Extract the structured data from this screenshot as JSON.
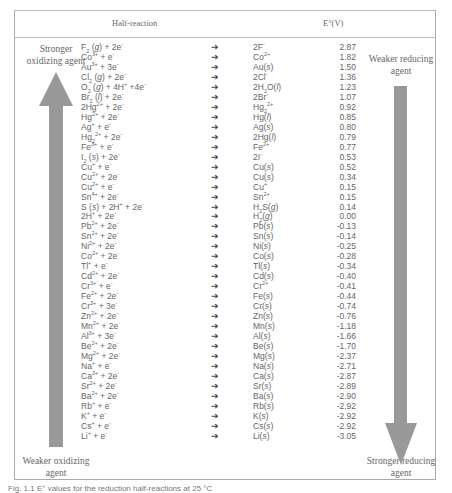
{
  "header": {
    "half_reaction": "Half-reaction",
    "potential": "E°(V)"
  },
  "labels": {
    "top_left": [
      "Stronger",
      "oxidizing agent"
    ],
    "bottom_left": [
      "Weaker oxidizing",
      "agent"
    ],
    "top_right": [
      "Weaker reducing",
      "agent"
    ],
    "bottom_right": [
      "Stronger reducing",
      "agent"
    ]
  },
  "arrow_symbol": "➔",
  "caption": "Fig. 1.1 E° values for the reduction half-reactions at 25 °C",
  "rows": [
    {
      "lhs": "F<sub>2</sub> (<i>g</i>) + 2e<sup>-</sup>",
      "rhs": "2F<sup>-</sup>",
      "e": "2.87"
    },
    {
      "lhs": "Co<sup>3+</sup> + e<sup>-</sup>",
      "rhs": "Co<sup>2+</sup>",
      "e": "1.82"
    },
    {
      "lhs": "Au<sup>3+</sup> + 3e<sup>-</sup>",
      "rhs": "Au(<i>s</i>)",
      "e": "1.50"
    },
    {
      "lhs": "Cl<sub>2</sub> (<i>g</i>) + 2e<sup>-</sup>",
      "rhs": "2Cl<sup>-</sup>",
      "e": "1.36"
    },
    {
      "lhs": "O<sub>2</sub> (<i>g</i>) + 4H<sup>+</sup> +4e<sup>-</sup>",
      "rhs": "2H<sub>2</sub>O(<i>l</i>)",
      "e": "1.23"
    },
    {
      "lhs": "Br<sub>2</sub> (<i>l</i>) + 2e<sup>-</sup>",
      "rhs": "2Br<sup>-</sup>",
      "e": "1.07"
    },
    {
      "lhs": "2Hg<sup>2+</sup> + 2e<sup>-</sup>",
      "rhs": "Hg<sub>2</sub><sup>2+</sup>",
      "e": "0.92"
    },
    {
      "lhs": "Hg<sup>2+</sup> + 2e<sup>-</sup>",
      "rhs": "Hg(<i>l</i>)",
      "e": "0.85"
    },
    {
      "lhs": "Ag<sup>+</sup> + e<sup>-</sup>",
      "rhs": "Ag(<i>s</i>)",
      "e": "0.80"
    },
    {
      "lhs": "Hg<sub>2</sub><sup>2+</sup> + 2e<sup>-</sup>",
      "rhs": "2Hg(<i>l</i>)",
      "e": "0.79"
    },
    {
      "lhs": "Fe<sup>3+</sup> + e<sup>-</sup>",
      "rhs": "Fe<sup>2+</sup>",
      "e": "0.77"
    },
    {
      "lhs": "I<sub>2</sub> (<i>s</i>) + 2e<sup>-</sup>",
      "rhs": "2I<sup>-</sup>",
      "e": "0.53"
    },
    {
      "lhs": "Cu<sup>+</sup> + e<sup>-</sup>",
      "rhs": "Cu(<i>s</i>)",
      "e": "0.52"
    },
    {
      "lhs": "Cu<sup>2+</sup> + 2e<sup>-</sup>",
      "rhs": "Cu(<i>s</i>)",
      "e": "0.34"
    },
    {
      "lhs": "Cu<sup>2+</sup> + e<sup>-</sup>",
      "rhs": "Cu<sup>+</sup>",
      "e": "0.15"
    },
    {
      "lhs": "Sn<sup>4+</sup> + 2e<sup>-</sup>",
      "rhs": "Sn<sup>2+</sup>",
      "e": "0.15"
    },
    {
      "lhs": "S (<i>s</i>) + 2H<sup>+</sup> + 2e<sup>-</sup>",
      "rhs": "H<sub>2</sub>S(<i>g</i>)",
      "e": "0.14"
    },
    {
      "lhs": "2H<sup>+</sup> + 2e<sup>-</sup>",
      "rhs": "H<sub>2</sub>(<i>g</i>)",
      "e": "0.00"
    },
    {
      "lhs": "Pb<sup>2+</sup> + 2e<sup>-</sup>",
      "rhs": "Pb(<i>s</i>)",
      "e": "-0.13"
    },
    {
      "lhs": "Sn<sup>2+</sup> + 2e<sup>-</sup>",
      "rhs": "Sn(<i>s</i>)",
      "e": "-0.14"
    },
    {
      "lhs": "Ni<sup>2+</sup> + 2e<sup>-</sup>",
      "rhs": "Ni(<i>s</i>)",
      "e": "-0.25"
    },
    {
      "lhs": "Co<sup>2+</sup> + 2e<sup>-</sup>",
      "rhs": "Co(<i>s</i>)",
      "e": "-0.28"
    },
    {
      "lhs": "Tl<sup>+</sup> + e<sup>-</sup>",
      "rhs": "Tl(<i>s</i>)",
      "e": "-0.34"
    },
    {
      "lhs": "Cd<sup>2+</sup> + 2e<sup>-</sup>",
      "rhs": "Cd(<i>s</i>)",
      "e": "-0.40"
    },
    {
      "lhs": "Cr<sup>3+</sup> + e<sup>-</sup>",
      "rhs": "Cr<sup>2+</sup>",
      "e": "-0.41"
    },
    {
      "lhs": "Fe<sup>2+</sup> + 2e<sup>-</sup>",
      "rhs": "Fe(<i>s</i>)",
      "e": "-0.44"
    },
    {
      "lhs": "Cr<sup>3+</sup> + 3e<sup>-</sup>",
      "rhs": "Cr(<i>s</i>)",
      "e": "-0.74"
    },
    {
      "lhs": "Zn<sup>2+</sup> + 2e<sup>-</sup>",
      "rhs": "Zn(<i>s</i>)",
      "e": "-0.76"
    },
    {
      "lhs": "Mn<sup>2+</sup> + 2e<sup>-</sup>",
      "rhs": "Mn(<i>s</i>)",
      "e": "-1.18"
    },
    {
      "lhs": "Al<sup>3+</sup> + 3e<sup>-</sup>",
      "rhs": "Al(<i>s</i>)",
      "e": "-1.66"
    },
    {
      "lhs": "Be<sup>2+</sup> + 2e<sup>-</sup>",
      "rhs": "Be(<i>s</i>)",
      "e": "-1.70"
    },
    {
      "lhs": "Mg<sup>2+</sup> + 2e<sup>-</sup>",
      "rhs": "Mg(<i>s</i>)",
      "e": "-2.37"
    },
    {
      "lhs": "Na<sup>+</sup> + e<sup>-</sup>",
      "rhs": "Na(<i>s</i>)",
      "e": "-2.71"
    },
    {
      "lhs": "Ca<sup>2+</sup> + 2e<sup>-</sup>",
      "rhs": "Ca(<i>s</i>)",
      "e": "-2.87"
    },
    {
      "lhs": "Sr<sup>2+</sup> + 2e<sup>-</sup>",
      "rhs": "Sr(<i>s</i>)",
      "e": "-2.89"
    },
    {
      "lhs": "Ba<sup>2+</sup> + 2e<sup>-</sup>",
      "rhs": "Ba(<i>s</i>)",
      "e": "-2.90"
    },
    {
      "lhs": "Rb<sup>+</sup> + e<sup>-</sup>",
      "rhs": "Rb(<i>s</i>)",
      "e": "-2.92"
    },
    {
      "lhs": "K<sup>+</sup> + e<sup>-</sup>",
      "rhs": "K(<i>s</i>)",
      "e": "-2.92"
    },
    {
      "lhs": "Cs<sup>+</sup> + e<sup>-</sup>",
      "rhs": "Cs(<i>s</i>)",
      "e": "-2.92"
    },
    {
      "lhs": "Li<sup>+</sup> + e<sup>-</sup>",
      "rhs": "Li(<i>s</i>)",
      "e": "-3.05"
    }
  ]
}
